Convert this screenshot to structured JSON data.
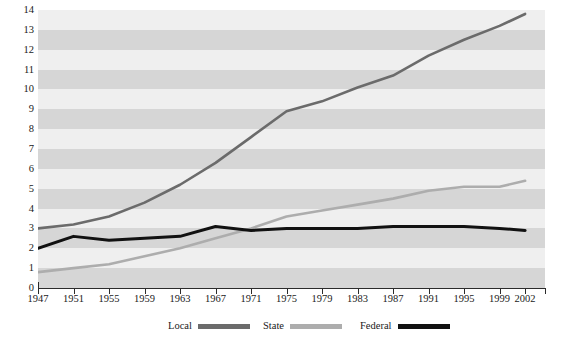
{
  "chart_data": {
    "type": "line",
    "title": "",
    "subtitle": "",
    "xlabel": "",
    "ylabel": "",
    "xlim": [
      1947,
      2002
    ],
    "ylim": [
      0,
      14
    ],
    "grid": "horizontal-alternating-bands",
    "legend_position": "bottom-center",
    "x_tick_labels": [
      "1947",
      "1951",
      "1955",
      "1959",
      "1963",
      "1967",
      "1971",
      "1975",
      "1979",
      "1983",
      "1987",
      "1991",
      "1995",
      "1999",
      "2002"
    ],
    "x_tick_values": [
      1947,
      1951,
      1955,
      1959,
      1963,
      1967,
      1971,
      1975,
      1979,
      1983,
      1987,
      1991,
      1995,
      1999,
      2002
    ],
    "y_tick_labels": [
      "0",
      "1",
      "2",
      "3",
      "4",
      "5",
      "6",
      "7",
      "8",
      "9",
      "10",
      "11",
      "12",
      "13",
      "14"
    ],
    "y_tick_values": [
      0,
      1,
      2,
      3,
      4,
      5,
      6,
      7,
      8,
      9,
      10,
      11,
      12,
      13,
      14
    ],
    "x": [
      1947,
      1951,
      1955,
      1959,
      1963,
      1967,
      1971,
      1975,
      1979,
      1983,
      1987,
      1991,
      1995,
      1999,
      2002
    ],
    "series": [
      {
        "name": "Local",
        "color": "#6b6b6b",
        "values": [
          3.0,
          3.2,
          3.6,
          4.3,
          5.2,
          6.3,
          7.6,
          8.9,
          9.4,
          10.1,
          10.7,
          11.7,
          12.5,
          13.2,
          13.8
        ]
      },
      {
        "name": "State",
        "color": "#adadad",
        "values": [
          0.8,
          1.0,
          1.2,
          1.6,
          2.0,
          2.5,
          3.0,
          3.6,
          3.9,
          4.2,
          4.5,
          4.9,
          5.1,
          5.1,
          5.4
        ]
      },
      {
        "name": "Federal",
        "color": "#111111",
        "values": [
          2.0,
          2.6,
          2.4,
          2.5,
          2.6,
          3.1,
          2.9,
          3.0,
          3.0,
          3.0,
          3.1,
          3.1,
          3.1,
          3.0,
          2.9
        ]
      }
    ]
  },
  "legend": {
    "items": [
      {
        "label": "Local",
        "color": "#6b6b6b"
      },
      {
        "label": "State",
        "color": "#adadad"
      },
      {
        "label": "Federal",
        "color": "#111111"
      }
    ]
  },
  "colors": {
    "band_dark": "#d6d6d6",
    "band_light": "#efefef",
    "axis": "#2b2b2b",
    "background": "#ffffff"
  }
}
